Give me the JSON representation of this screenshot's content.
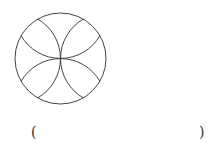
{
  "figure": {
    "stroke_color": "#444444",
    "circle": {
      "cx": 60.5,
      "cy": 58.5,
      "r": 45.5
    }
  },
  "answer_blank": {
    "open": "(",
    "close": ")"
  }
}
